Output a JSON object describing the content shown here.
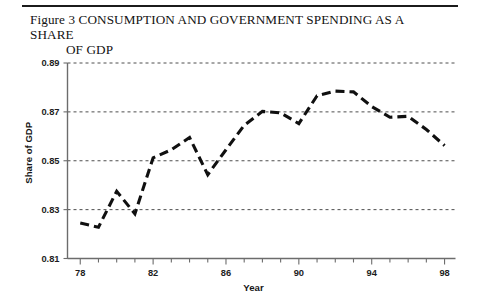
{
  "figure": {
    "title_line1": "Figure 3 CONSUMPTION AND GOVERNMENT SPENDING AS A SHARE",
    "title_line2": "OF GDP"
  },
  "chart_data": {
    "type": "line",
    "title": "Figure 3 CONSUMPTION AND GOVERNMENT SPENDING AS A SHARE OF GDP",
    "xlabel": "Year",
    "ylabel": "Share of GDP",
    "xlim": [
      77.3,
      98.6
    ],
    "ylim": [
      0.81,
      0.89
    ],
    "yticks": [
      0.81,
      0.83,
      0.85,
      0.87,
      0.89
    ],
    "ytick_labels": [
      "0.81",
      "0.83",
      "0.85",
      "0.87",
      "0.89"
    ],
    "xticks": [
      78,
      82,
      86,
      90,
      94,
      98
    ],
    "xtick_labels": [
      "78",
      "82",
      "86",
      "90",
      "94",
      "98"
    ],
    "x_minor_tick_step": 1,
    "grid": true,
    "grid_axis": "y",
    "grid_style": "dotted",
    "legend": null,
    "line_style": "dashed",
    "line_color": "#101010",
    "x": [
      78,
      79,
      80,
      81,
      82,
      83,
      84,
      85,
      86,
      87,
      88,
      89,
      90,
      91,
      92,
      93,
      94,
      95,
      96,
      97,
      98
    ],
    "values": [
      0.8245,
      0.8228,
      0.8375,
      0.8283,
      0.8512,
      0.8545,
      0.8595,
      0.8443,
      0.8545,
      0.8645,
      0.8702,
      0.8696,
      0.8652,
      0.8766,
      0.8785,
      0.8782,
      0.8722,
      0.8678,
      0.8682,
      0.8628,
      0.8562
    ]
  }
}
